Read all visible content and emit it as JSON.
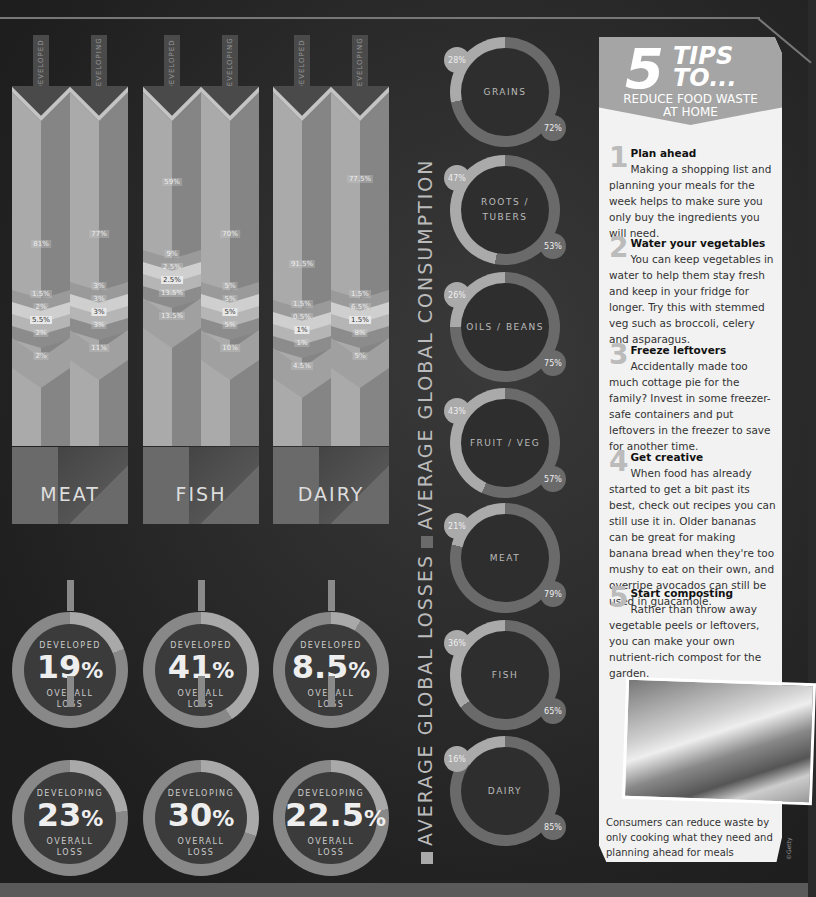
{
  "chart_data": [
    {
      "type": "bar",
      "title": "Breakdown of food losses by supply chain stage",
      "categories": [
        "Meat",
        "Fish",
        "Dairy"
      ],
      "series": [
        {
          "name": "Meat developed",
          "values": [
            81,
            1.5,
            2,
            5.5,
            2,
            2
          ]
        },
        {
          "name": "Meat developing",
          "values": [
            77,
            3,
            3,
            3,
            3,
            11
          ]
        },
        {
          "name": "Fish developed",
          "values": [
            59,
            9,
            2.5,
            2.5,
            13.5,
            13.5
          ]
        },
        {
          "name": "Fish developing",
          "values": [
            70,
            5,
            5,
            5,
            5,
            10
          ]
        },
        {
          "name": "Dairy developed",
          "values": [
            91.5,
            1.5,
            0.5,
            1,
            1,
            4.5
          ]
        },
        {
          "name": "Dairy developing",
          "values": [
            77.5,
            1.5,
            6.5,
            1.5,
            8,
            5
          ]
        }
      ]
    },
    {
      "type": "pie",
      "title": "Average global losses vs average global consumption",
      "categories": [
        "Grains",
        "Roots / Tubers",
        "Oils / Beans",
        "Fruit / Veg",
        "Meat",
        "Fish",
        "Dairy"
      ],
      "series": [
        {
          "name": "Average global losses",
          "values": [
            28,
            47,
            26,
            43,
            21,
            36,
            16
          ]
        },
        {
          "name": "Average global consumption",
          "values": [
            72,
            53,
            75,
            57,
            79,
            65,
            85
          ]
        }
      ]
    },
    {
      "type": "pie",
      "title": "Overall loss",
      "categories": [
        "Meat",
        "Fish",
        "Dairy"
      ],
      "series": [
        {
          "name": "Developed",
          "values": [
            19,
            41,
            8.5
          ]
        },
        {
          "name": "Developing",
          "values": [
            23,
            30,
            22.5
          ]
        }
      ]
    }
  ],
  "columns": [
    {
      "tag": "DEVELOPED",
      "top": "81%",
      "segs": [
        "1.5%",
        "2%",
        "5.5%",
        "2%",
        "2%"
      ]
    },
    {
      "tag": "DEVELOPING",
      "top": "77%",
      "segs": [
        "3%",
        "3%",
        "3%",
        "3%",
        "11%"
      ]
    },
    {
      "tag": "DEVELOPED",
      "top": "59%",
      "segs": [
        "9%",
        "2.5%",
        "2.5%",
        "13.5%",
        "13.5%"
      ]
    },
    {
      "tag": "DEVELOPING",
      "top": "70%",
      "segs": [
        "5%",
        "5%",
        "5%",
        "5%",
        "10%"
      ]
    },
    {
      "tag": "DEVELOPED",
      "top": "91.5%",
      "segs": [
        "1.5%",
        "0.5%",
        "1%",
        "1%",
        "4.5%"
      ]
    },
    {
      "tag": "DEVELOPING",
      "top": "77.5%",
      "segs": [
        "1.5%",
        "6.5%",
        "1.5%",
        "8%",
        "5%"
      ]
    }
  ],
  "categories": [
    "MEAT",
    "FISH",
    "DAIRY"
  ],
  "rings": {
    "developed": [
      {
        "label": "DEVELOPED",
        "value": "19",
        "pct": "%",
        "sub1": "OVERALL",
        "sub2": "LOSS"
      },
      {
        "label": "DEVELOPED",
        "value": "41",
        "pct": "%",
        "sub1": "OVERALL",
        "sub2": "LOSS"
      },
      {
        "label": "DEVELOPED",
        "value": "8.5",
        "pct": "%",
        "sub1": "OVERALL",
        "sub2": "LOSS"
      }
    ],
    "developing": [
      {
        "label": "DEVELOPING",
        "value": "23",
        "pct": "%",
        "sub1": "OVERALL",
        "sub2": "LOSS"
      },
      {
        "label": "DEVELOPING",
        "value": "30",
        "pct": "%",
        "sub1": "OVERALL",
        "sub2": "LOSS"
      },
      {
        "label": "DEVELOPING",
        "value": "22.5",
        "pct": "%",
        "sub1": "OVERALL",
        "sub2": "LOSS"
      }
    ]
  },
  "legend": {
    "losses": "AVERAGE GLOBAL LOSSES",
    "consumption": "AVERAGE GLOBAL CONSUMPTION"
  },
  "donuts": [
    {
      "name": "GRAINS",
      "loss": "28%",
      "cons": "72%"
    },
    {
      "name": "ROOTS /",
      "name2": "TUBERS",
      "loss": "47%",
      "cons": "53%"
    },
    {
      "name": "OILS / BEANS",
      "loss": "26%",
      "cons": "75%"
    },
    {
      "name": "FRUIT / VEG",
      "loss": "43%",
      "cons": "57%"
    },
    {
      "name": "MEAT",
      "loss": "21%",
      "cons": "79%"
    },
    {
      "name": "FISH",
      "loss": "36%",
      "cons": "65%"
    },
    {
      "name": "DAIRY",
      "loss": "16%",
      "cons": "85%"
    }
  ],
  "panel": {
    "five": "5",
    "tips": "TIPS",
    "to": "TO...",
    "sub1": "REDUCE FOOD WASTE",
    "sub2": "AT HOME",
    "items": [
      {
        "num": "1",
        "title": "Plan ahead",
        "body": "Making a shopping list and planning your meals for the week helps to make sure you only buy the ingredients you will need."
      },
      {
        "num": "2",
        "title": "Water your vegetables",
        "body": "You can keep vegetables in water to help them stay fresh and keep in your fridge for longer. Try this with stemmed veg such as broccoli, celery and asparagus."
      },
      {
        "num": "3",
        "title": "Freeze leftovers",
        "body": "Accidentally made too much cottage pie for the family? Invest in some freezer-safe containers and put leftovers in the freezer to save for another time."
      },
      {
        "num": "4",
        "title": "Get creative",
        "body": "When food has already started to get a bit past its best, check out recipes you can still use it in. Older bananas can be great for making banana bread when they're too mushy to eat on their own, and overripe avocados can still be used in guacamole."
      },
      {
        "num": "5",
        "title": "Start composting",
        "body": "Rather than throw away vegetable peels or leftovers, you can make your own nutrient-rich compost for the garden."
      }
    ],
    "caption": "Consumers can reduce waste by only cooking what they need and planning ahead for meals",
    "credit": "©Getty"
  }
}
